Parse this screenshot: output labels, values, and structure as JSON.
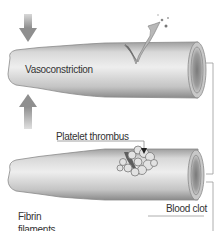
{
  "diagram": {
    "labels": {
      "vasoconstriction": "Vasoconstriction",
      "platelet_thrombus": "Platelet thrombus",
      "fibrin_line1": "Fibrin",
      "fibrin_line2": "filaments",
      "blood_clot": "Blood clot"
    },
    "elements": [
      {
        "id": "arrow-down",
        "kind": "arrow",
        "direction": "down"
      },
      {
        "id": "arrow-up",
        "kind": "arrow",
        "direction": "up"
      },
      {
        "id": "vessel-top",
        "kind": "blood-vessel",
        "state": "constricted, injured with spurting blood"
      },
      {
        "id": "vessel-bottom",
        "kind": "blood-vessel",
        "state": "platelet plug at injury site"
      },
      {
        "id": "bracket-right",
        "kind": "connector"
      }
    ],
    "colors": {
      "vessel_light": "#e6e6e6",
      "vessel_mid": "#bdbdbd",
      "vessel_dark": "#8c8c8c",
      "arrow": "#9a9a9a",
      "text": "#333333",
      "line": "#9a9a9a"
    }
  }
}
